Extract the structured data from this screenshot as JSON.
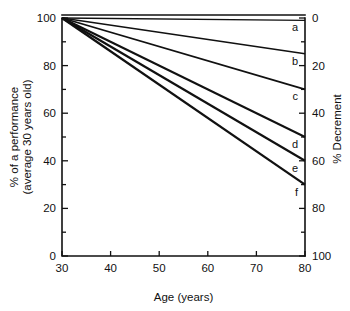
{
  "chart_data": {
    "type": "line",
    "title": "",
    "xlabel": "Age (years)",
    "ylabel": "% of a performance (average 30 years old)",
    "ylabel_line1": "% of a performance",
    "ylabel_line2": "(average 30 years old)",
    "y2label": "% Decrement",
    "xlim": [
      30,
      80
    ],
    "ylim": [
      0,
      100
    ],
    "y2lim": [
      0,
      100
    ],
    "grid": false,
    "legend": "inline-right-end-labels",
    "xticks": [
      30,
      40,
      50,
      60,
      70,
      80
    ],
    "xticklabels": [
      "30",
      "40",
      "50",
      "60",
      "70",
      "80"
    ],
    "xminorticks": [
      35,
      45,
      55,
      65,
      75
    ],
    "yticks": [
      0,
      20,
      40,
      60,
      80,
      100
    ],
    "yticklabels": [
      "0",
      "20",
      "40",
      "60",
      "80",
      "100"
    ],
    "yminorticks": [
      10,
      30,
      50,
      70,
      90
    ],
    "y2ticks": [
      0,
      20,
      40,
      60,
      80,
      100
    ],
    "y2ticklabels": [
      "0",
      "20",
      "40",
      "60",
      "80",
      "100"
    ],
    "y2minorticks": [
      10,
      30,
      50,
      70,
      90
    ],
    "x": [
      30,
      80
    ],
    "series": [
      {
        "name": "a",
        "label": "a",
        "values": [
          100,
          99
        ],
        "decrement": [
          0,
          1
        ],
        "color": "#111111"
      },
      {
        "name": "b",
        "label": "b",
        "values": [
          100,
          85
        ],
        "decrement": [
          0,
          15
        ],
        "color": "#111111"
      },
      {
        "name": "c",
        "label": "c",
        "values": [
          100,
          70
        ],
        "decrement": [
          0,
          30
        ],
        "color": "#111111"
      },
      {
        "name": "d",
        "label": "d",
        "values": [
          100,
          50
        ],
        "decrement": [
          0,
          50
        ],
        "color": "#111111"
      },
      {
        "name": "e",
        "label": "e",
        "values": [
          100,
          40
        ],
        "decrement": [
          0,
          60
        ],
        "color": "#111111"
      },
      {
        "name": "f",
        "label": "f",
        "values": [
          100,
          30
        ],
        "decrement": [
          0,
          70
        ],
        "color": "#111111"
      }
    ]
  },
  "figure": {
    "background": "#ffffff",
    "axis_color": "#111111"
  }
}
